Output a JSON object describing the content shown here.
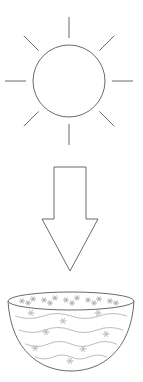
{
  "diagram": {
    "background_color": "#ffffff",
    "line_color": "#6b6b6b",
    "detail_color": "#b4b4b4",
    "canvas": {
      "width": 143,
      "height": 382
    }
  },
  "sun": {
    "label": "sun",
    "center_x": 69,
    "center_y": 81,
    "radius": 36,
    "ray_count": 8,
    "ray_inner_radius": 43,
    "ray_outer_radius": 64,
    "rays": [
      {
        "name": "ray-north",
        "angle_deg": 270
      },
      {
        "name": "ray-northeast",
        "angle_deg": 315
      },
      {
        "name": "ray-east",
        "angle_deg": 0
      },
      {
        "name": "ray-southeast",
        "angle_deg": 45
      },
      {
        "name": "ray-south",
        "angle_deg": 90
      },
      {
        "name": "ray-southwest",
        "angle_deg": 135
      },
      {
        "name": "ray-west",
        "angle_deg": 180
      },
      {
        "name": "ray-northwest",
        "angle_deg": 225
      }
    ]
  },
  "arrow": {
    "label": "downward arrow",
    "direction": "down",
    "shaft_left_x": 54,
    "shaft_right_x": 86,
    "shaft_top_y": 167,
    "head_left_x": 42,
    "head_right_x": 98,
    "head_top_y": 219,
    "tip_x": 70,
    "tip_y": 271
  },
  "bowl": {
    "label": "bowl of water",
    "rim_center_x": 71,
    "rim_center_y": 301,
    "rim_radius_x": 63,
    "rim_radius_y": 9,
    "bottom_y": 371,
    "left_x": 8,
    "right_x": 134,
    "waves": [
      {
        "y": 316,
        "amplitude": 5
      },
      {
        "y": 330,
        "amplitude": 5
      },
      {
        "y": 344,
        "amplitude": 5
      },
      {
        "y": 357,
        "amplitude": 4
      }
    ],
    "water_motifs": [
      {
        "x": 31,
        "y": 313
      },
      {
        "x": 63,
        "y": 321
      },
      {
        "x": 98,
        "y": 313
      },
      {
        "x": 46,
        "y": 332
      },
      {
        "x": 106,
        "y": 334
      },
      {
        "x": 83,
        "y": 349
      },
      {
        "x": 35,
        "y": 348
      },
      {
        "x": 70,
        "y": 361
      }
    ],
    "rim_motifs": [
      {
        "x": 22,
        "y": 301
      },
      {
        "x": 33,
        "y": 299
      },
      {
        "x": 44,
        "y": 300
      },
      {
        "x": 55,
        "y": 298
      },
      {
        "x": 66,
        "y": 300
      },
      {
        "x": 77,
        "y": 298
      },
      {
        "x": 88,
        "y": 300
      },
      {
        "x": 99,
        "y": 299
      },
      {
        "x": 110,
        "y": 301
      },
      {
        "x": 28,
        "y": 303
      },
      {
        "x": 50,
        "y": 303
      },
      {
        "x": 72,
        "y": 303
      },
      {
        "x": 94,
        "y": 303
      },
      {
        "x": 116,
        "y": 303
      }
    ]
  }
}
